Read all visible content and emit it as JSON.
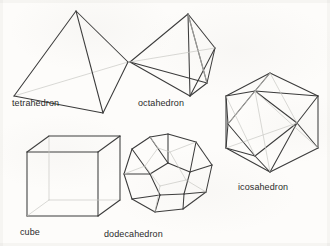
{
  "figure": {
    "background_color": "#fdfcfa",
    "line_color": "#3a3a3a",
    "hidden_line_color": "#c9c8c4",
    "label_color": "#2b2b2b"
  },
  "solids": [
    {
      "id": "tetrahedron",
      "label": "tetrahedron",
      "label_x": 12,
      "label_y": 99,
      "faces": 4,
      "vertices": [
        [
          76,
          11
        ],
        [
          14,
          96
        ],
        [
          128,
          62
        ],
        [
          103,
          113
        ]
      ],
      "visible_edges": [
        [
          0,
          1
        ],
        [
          0,
          2
        ],
        [
          0,
          3
        ],
        [
          1,
          3
        ],
        [
          2,
          3
        ]
      ],
      "hidden_edges": [
        [
          1,
          2
        ]
      ]
    },
    {
      "id": "octahedron",
      "label": "octahedron",
      "label_x": 138,
      "label_y": 99,
      "faces": 8,
      "vertices": [
        [
          188,
          14
        ],
        [
          130,
          62
        ],
        [
          215,
          48
        ],
        [
          190,
          96
        ],
        [
          207,
          83
        ]
      ],
      "visible_edges": [
        [
          0,
          1
        ],
        [
          0,
          2
        ],
        [
          0,
          3
        ],
        [
          0,
          4
        ],
        [
          1,
          3
        ],
        [
          2,
          3
        ],
        [
          2,
          4
        ],
        [
          1,
          4
        ],
        [
          3,
          4
        ]
      ],
      "hidden_edges": []
    },
    {
      "id": "icosahedron",
      "label": "icosahedron",
      "label_x": 238,
      "label_y": 183,
      "faces": 20,
      "outline": [
        [
          270,
          73
        ],
        [
          318,
          96
        ],
        [
          318,
          148
        ],
        [
          270,
          172
        ],
        [
          226,
          148
        ],
        [
          226,
          96
        ]
      ],
      "inner": [
        [
          255,
          91
        ],
        [
          297,
          123
        ],
        [
          255,
          156
        ],
        [
          228,
          124
        ]
      ],
      "visible_edges": [],
      "hidden_edges": []
    },
    {
      "id": "cube",
      "label": "cube",
      "label_x": 20,
      "label_y": 228,
      "faces": 6,
      "front": [
        [
          27,
          152
        ],
        [
          98,
          152
        ],
        [
          98,
          216
        ],
        [
          27,
          216
        ]
      ],
      "back_offset": [
        22,
        -16
      ],
      "visible_edges": [],
      "hidden_edges": []
    },
    {
      "id": "dodecahedron",
      "label": "dodecahedron",
      "label_x": 104,
      "label_y": 230,
      "faces": 12,
      "outline": [
        [
          168,
          134
        ],
        [
          196,
          142
        ],
        [
          212,
          165
        ],
        [
          206,
          192
        ],
        [
          183,
          209
        ],
        [
          155,
          212
        ],
        [
          132,
          199
        ],
        [
          124,
          174
        ],
        [
          132,
          149
        ],
        [
          150,
          137
        ]
      ],
      "visible_edges": [],
      "hidden_edges": []
    }
  ]
}
